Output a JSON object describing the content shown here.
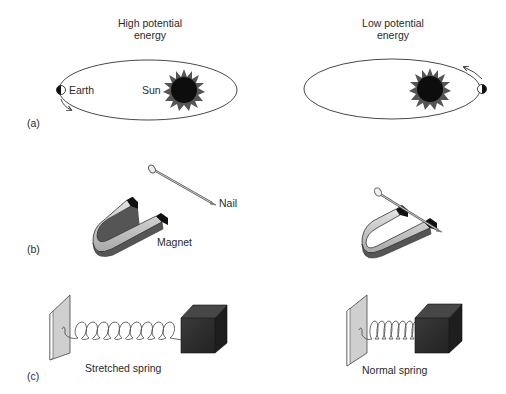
{
  "headers": {
    "left": [
      "High potential",
      "energy"
    ],
    "right": [
      "Low potential",
      "energy"
    ]
  },
  "panels": {
    "a": {
      "label": "(a)",
      "earth_label": "Earth",
      "sun_label": "Sun"
    },
    "b": {
      "label": "(b)",
      "nail_label": "Nail",
      "magnet_label": "Magnet"
    },
    "c": {
      "label": "(c)",
      "stretched_label": "Stretched spring",
      "normal_label": "Normal spring"
    }
  },
  "colors": {
    "sun": "#0d0d0d",
    "corona": "#555555",
    "magnet_body": "#c8c8c8",
    "magnet_shadow": "#555555",
    "magnet_pole": "#111111",
    "block": "#2e2e2e",
    "wall": "#cfcfcf",
    "line": "#333333"
  }
}
